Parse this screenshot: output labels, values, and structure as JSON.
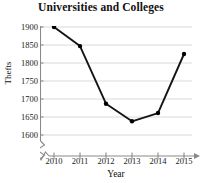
{
  "chart_data": {
    "type": "line",
    "title": "Universities and Colleges",
    "xlabel": "Year",
    "ylabel": "Thefts",
    "categories": [
      "2010",
      "2011",
      "2012",
      "2013",
      "2014",
      "2015"
    ],
    "x": [
      2010,
      2011,
      2012,
      2013,
      2014,
      2015
    ],
    "values": [
      1900,
      1847,
      1687,
      1638,
      1661,
      1825
    ],
    "series": [
      {
        "name": "Thefts",
        "values": [
          1900,
          1847,
          1687,
          1638,
          1661,
          1825
        ]
      }
    ],
    "ylim": [
      1600,
      1900
    ],
    "xlim": [
      2010,
      2015
    ],
    "y_ticks": [
      1600,
      1650,
      1700,
      1750,
      1800,
      1850,
      1900
    ],
    "y_tick_labels": [
      "1600",
      "1650",
      "1700",
      "1750",
      "1800",
      "1850",
      "1900"
    ],
    "x_ticks": [
      2010,
      2011,
      2012,
      2013,
      2014,
      2015
    ],
    "x_tick_labels": [
      "2010",
      "2011",
      "2012",
      "2013",
      "2014",
      "2015"
    ],
    "grid": true,
    "grid_axis": "y",
    "legend": false,
    "legend_position": "none",
    "y_axis_break": true,
    "x_axis_break": true,
    "marker": "filled-circle",
    "line_color": "#151515",
    "marker_color": "#000000",
    "grid_color": "#d6d6d6",
    "axis_color": "#8a8a8a",
    "background_color": "#ffffff"
  }
}
